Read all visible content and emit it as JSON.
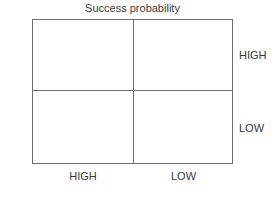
{
  "chart_data": {
    "type": "table",
    "title": "Success probability",
    "xlabel": "Success probability",
    "ylabel": "Attractiveness",
    "grid": true,
    "legend": "none",
    "subtitle": "",
    "columns": [
      "HIGH",
      "LOW"
    ],
    "rows": [
      "HIGH",
      "LOW"
    ],
    "cells": [
      [
        {
          "row": "HIGH",
          "column": "HIGH",
          "value": ""
        },
        {
          "row": "HIGH",
          "column": "LOW",
          "value": ""
        }
      ],
      [
        {
          "row": "LOW",
          "column": "HIGH",
          "value": ""
        },
        {
          "row": "LOW",
          "column": "LOW",
          "value": ""
        }
      ]
    ],
    "annotations": []
  },
  "diagram": {
    "title": "Success probability",
    "vertical_axis_label": "Attractiveness",
    "row_labels": {
      "top": "HIGH",
      "bottom": "LOW"
    },
    "column_labels": {
      "left": "HIGH",
      "right": "LOW"
    }
  },
  "colors": {
    "line": "#6e6e6e",
    "text": "#3a3a3a",
    "background": "#ffffff"
  }
}
